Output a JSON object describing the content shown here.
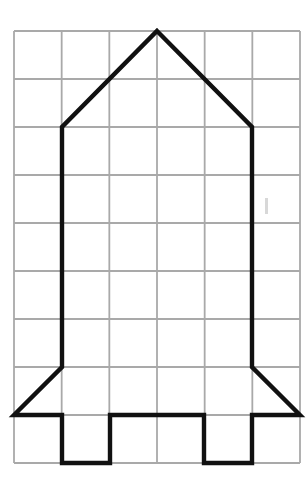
{
  "page": {
    "background_color": "#ffffff",
    "width": 307,
    "height": 483
  },
  "grid": {
    "name": "square-grid",
    "origin_x": 14,
    "origin_y": 31,
    "columns": 6,
    "rows": 9,
    "cell_width": 47.7,
    "cell_height": 48,
    "right_x": 300,
    "bottom_y": 463,
    "line_color": "#a9a9a9",
    "line_width": 1.8
  },
  "figure": {
    "name": "rocket-outline",
    "stroke_color": "#111111",
    "stroke_width": 4.4,
    "fill": "none",
    "line_join": "miter",
    "points": [
      [
        157,
        31
      ],
      [
        252,
        127
      ],
      [
        252,
        367
      ],
      [
        300,
        415
      ],
      [
        252,
        415
      ],
      [
        252,
        463
      ],
      [
        204,
        463
      ],
      [
        204,
        415
      ],
      [
        110,
        415
      ],
      [
        110,
        463
      ],
      [
        62,
        463
      ],
      [
        62,
        415
      ],
      [
        14,
        415
      ],
      [
        62,
        367
      ],
      [
        62,
        127
      ]
    ],
    "path_d": "M 157 31 L 252 127 L 252 367 L 300 415 L 252 415 L 252 463 L 204 463 L 204 415 L 110 415 L 110 463 L 62 463 L 62 415 L 14 415 L 62 367 L 62 127 Z"
  },
  "artifact": {
    "name": "faint-smudge",
    "x": 265,
    "y": 198,
    "width": 3,
    "height": 16,
    "color": "#d8d8d8"
  }
}
